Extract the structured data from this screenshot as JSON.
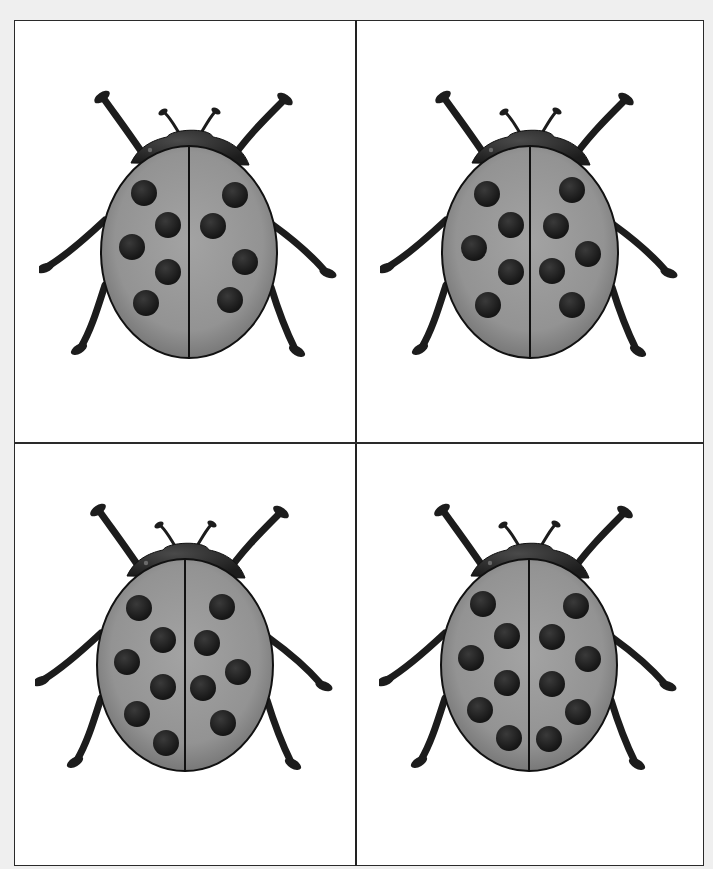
{
  "page": {
    "background": "#efefef",
    "frame_color": "#2a2a2a",
    "layout": "2x2 grid of ladybug counting cards"
  },
  "colors": {
    "shell": "#939393",
    "shell_edge": "#6e6e6e",
    "body_dark": "#1c1c1c",
    "spot": "#141414",
    "outline": "#111111"
  },
  "cards": [
    {
      "position": "top-left",
      "spot_count": 9,
      "spots_left": [
        [
          105,
          138
        ],
        [
          129,
          170
        ],
        [
          93,
          192
        ],
        [
          129,
          217
        ],
        [
          107,
          248
        ]
      ],
      "spots_right": [
        [
          196,
          140
        ],
        [
          174,
          171
        ],
        [
          206,
          207
        ],
        [
          191,
          245
        ]
      ]
    },
    {
      "position": "top-right",
      "spot_count": 10,
      "spots_left": [
        [
          107,
          139
        ],
        [
          131,
          170
        ],
        [
          94,
          193
        ],
        [
          131,
          217
        ],
        [
          108,
          250
        ]
      ],
      "spots_right": [
        [
          192,
          135
        ],
        [
          176,
          171
        ],
        [
          208,
          199
        ],
        [
          172,
          216
        ],
        [
          192,
          250
        ]
      ]
    },
    {
      "position": "bottom-left",
      "spot_count": 11,
      "spots_left": [
        [
          104,
          140
        ],
        [
          128,
          172
        ],
        [
          92,
          194
        ],
        [
          128,
          219
        ],
        [
          102,
          246
        ],
        [
          131,
          275
        ]
      ],
      "spots_right": [
        [
          187,
          139
        ],
        [
          172,
          175
        ],
        [
          203,
          204
        ],
        [
          168,
          220
        ],
        [
          188,
          255
        ]
      ]
    },
    {
      "position": "bottom-right",
      "spot_count": 12,
      "spots_left": [
        [
          104,
          136
        ],
        [
          128,
          168
        ],
        [
          92,
          190
        ],
        [
          128,
          215
        ],
        [
          101,
          242
        ],
        [
          130,
          270
        ]
      ],
      "spots_right": [
        [
          197,
          138
        ],
        [
          173,
          169
        ],
        [
          209,
          191
        ],
        [
          173,
          216
        ],
        [
          199,
          244
        ],
        [
          170,
          271
        ]
      ]
    }
  ]
}
